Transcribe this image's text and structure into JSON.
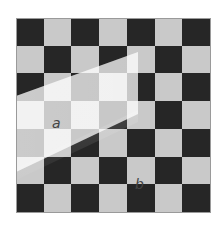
{
  "figure": {
    "type": "checker-shadow-illusion",
    "grid": {
      "rows": 7,
      "cols": 7,
      "pattern": [
        [
          "d",
          "l",
          "d",
          "l",
          "d",
          "l",
          "d"
        ],
        [
          "l",
          "d",
          "l",
          "d",
          "l",
          "d",
          "l"
        ],
        [
          "d",
          "l",
          "d",
          "l",
          "d",
          "l",
          "d"
        ],
        [
          "l",
          "d",
          "l",
          "d",
          "l",
          "d",
          "l"
        ],
        [
          "d",
          "l",
          "d",
          "l",
          "d",
          "l",
          "d"
        ],
        [
          "l",
          "d",
          "l",
          "d",
          "l",
          "d",
          "l"
        ],
        [
          "d",
          "l",
          "d",
          "l",
          "d",
          "l",
          "d"
        ]
      ]
    },
    "colors": {
      "dark_square": "#262626",
      "light_square": "#c9c9c9",
      "background": "#ffffff",
      "label": "#444444"
    },
    "labels": {
      "a": "a",
      "b": "b"
    }
  }
}
